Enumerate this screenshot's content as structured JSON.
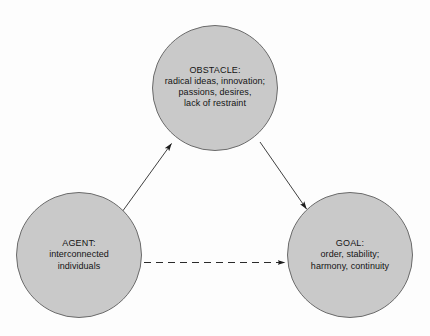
{
  "diagram": {
    "type": "node-link-diagram",
    "background_color": "#fdfdfd",
    "node_fill_color": "#c9c9c9",
    "node_stroke_color": "#6b6b6b",
    "text_color": "#141414",
    "nodes": [
      {
        "id": "obstacle",
        "title": "OBSTACLE:",
        "lines": [
          "radical ideas, innovation;",
          "passions, desires,",
          "lack of restraint"
        ]
      },
      {
        "id": "agent",
        "title": "AGENT:",
        "lines": [
          "interconnected",
          "individuals"
        ]
      },
      {
        "id": "goal",
        "title": "GOAL:",
        "lines": [
          "order, stability;",
          "harmony, continuity"
        ]
      }
    ],
    "edges": [
      {
        "id": "agent-to-obstacle",
        "from": "agent",
        "to": "obstacle",
        "style": "solid",
        "arrowhead": "end"
      },
      {
        "id": "obstacle-to-goal",
        "from": "obstacle",
        "to": "goal",
        "style": "solid",
        "arrowhead": "end"
      },
      {
        "id": "agent-to-goal",
        "from": "agent",
        "to": "goal",
        "style": "dashed",
        "arrowhead": "end"
      }
    ]
  }
}
